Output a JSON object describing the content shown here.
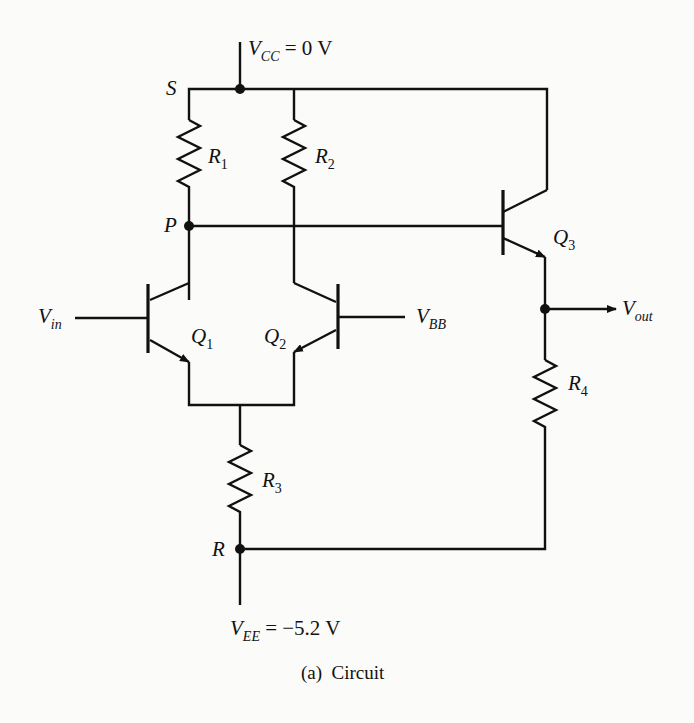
{
  "figure": {
    "caption": "(a)  Circuit",
    "ink_color": "#111111",
    "background": "#fbfbf9"
  },
  "supplies": {
    "vcc": {
      "symbol": "V",
      "subscript": "CC",
      "value": "= 0 V"
    },
    "vee": {
      "symbol": "V",
      "subscript": "EE",
      "value": "= −5.2 V"
    }
  },
  "nodes": {
    "s": "S",
    "p": "P",
    "r": "R"
  },
  "resistors": {
    "r1": {
      "symbol": "R",
      "subscript": "1"
    },
    "r2": {
      "symbol": "R",
      "subscript": "2"
    },
    "r3": {
      "symbol": "R",
      "subscript": "3"
    },
    "r4": {
      "symbol": "R",
      "subscript": "4"
    }
  },
  "transistors": {
    "q1": {
      "symbol": "Q",
      "subscript": "1",
      "type": "npn"
    },
    "q2": {
      "symbol": "Q",
      "subscript": "2",
      "type": "npn"
    },
    "q3": {
      "symbol": "Q",
      "subscript": "3",
      "type": "npn"
    }
  },
  "ports": {
    "vin": {
      "symbol": "V",
      "subscript": "in"
    },
    "vbb": {
      "symbol": "V",
      "subscript": "BB"
    },
    "vout": {
      "symbol": "V",
      "subscript": "out"
    }
  }
}
